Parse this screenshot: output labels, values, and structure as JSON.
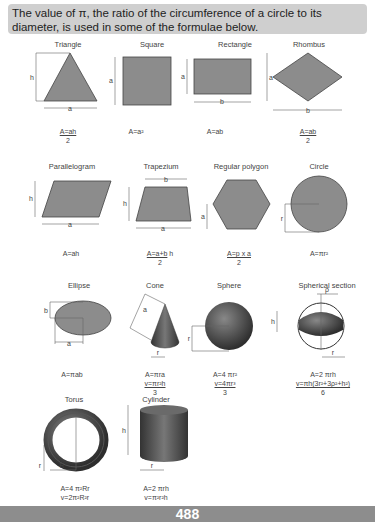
{
  "intro": "The value of π, the ratio of the circumference of a circle to its diameter, is used in some of the formulae below.",
  "shapes": [
    {
      "name": "Triangle",
      "formula": [
        "A=ah",
        "2"
      ],
      "labels": [
        "h",
        "a"
      ]
    },
    {
      "name": "Square",
      "formula": [
        "A=a²"
      ],
      "labels": [
        "a"
      ]
    },
    {
      "name": "Rectangle",
      "formula": [
        "A=ab"
      ],
      "labels": [
        "a",
        "b"
      ]
    },
    {
      "name": "Rhombus",
      "formula": [
        "A=ab",
        "2"
      ],
      "labels": [
        "a",
        "b"
      ]
    },
    {
      "name": "Parallelogram",
      "formula": [
        "A=ah"
      ],
      "labels": [
        "h",
        "a"
      ]
    },
    {
      "name": "Trapezium",
      "formula": [
        "A=a+b",
        "2",
        "h"
      ],
      "labels": [
        "b",
        "h",
        "a"
      ]
    },
    {
      "name": "Regular polygon",
      "formula": [
        "A=p x a",
        "2"
      ],
      "labels": [
        "a"
      ]
    },
    {
      "name": "Circle",
      "formula": [
        "A=πr²"
      ],
      "labels": [
        "r"
      ]
    },
    {
      "name": "Ellipse",
      "formula": [
        "A=πab"
      ],
      "labels": [
        "b",
        "a"
      ]
    },
    {
      "name": "Cone",
      "formula": [
        "A=πra",
        "v=πr²h",
        "3"
      ],
      "labels": [
        "a",
        "r"
      ]
    },
    {
      "name": "Sphere",
      "formula": [
        "A=4 πr²",
        "v=4πr³",
        "3"
      ],
      "labels": [
        "r"
      ]
    },
    {
      "name": "Spherical section",
      "formula": [
        "A=2 πrh",
        "v=πh(3r²+3ρ²+h²)",
        "6"
      ],
      "labels": [
        "ρ",
        "h",
        "r"
      ]
    },
    {
      "name": "Torus",
      "formula": [
        "A=4 π²Rr",
        "v=2π²R²r"
      ],
      "labels": [
        "r",
        "R"
      ]
    },
    {
      "name": "Cylinder",
      "formula": [
        "A=2 πrh",
        "v=π²r²h"
      ],
      "labels": [
        "h",
        "r"
      ]
    }
  ],
  "page_number": "488",
  "colors": {
    "shape_fill": "#8c8c8c",
    "banner": "#cfcfcf",
    "footer": "#8d8d8d"
  }
}
